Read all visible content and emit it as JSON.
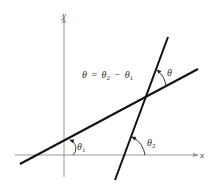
{
  "figure": {
    "type": "diagram",
    "axes": {
      "x_label": "x",
      "y_label": "y"
    },
    "equation": {
      "lhs": "θ",
      "eq": "=",
      "term1": "θ",
      "sub1": "2",
      "minus": "−",
      "term2": "θ",
      "sub2": "1"
    },
    "angles": {
      "theta1": {
        "symbol": "θ",
        "sub": "1"
      },
      "theta2": {
        "symbol": "θ",
        "sub": "2"
      },
      "theta": {
        "symbol": "θ"
      }
    },
    "colors": {
      "axis": "#999999",
      "line": "#111111",
      "arc": "#222222",
      "text": "#333333"
    }
  }
}
